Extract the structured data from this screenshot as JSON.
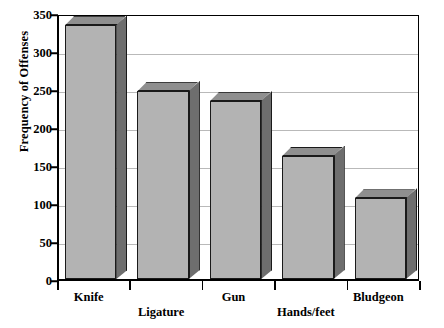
{
  "chart_data": {
    "type": "bar",
    "title": "",
    "subtitle": "",
    "xlabel": "",
    "ylabel": "Frequency of Offenses",
    "categories": [
      "Knife",
      "Ligature",
      "Gun",
      "Hands/feet",
      "Bludgeon"
    ],
    "values": [
      334,
      247,
      234,
      162,
      106
    ],
    "ylim": [
      0,
      350
    ],
    "yticks": [
      0,
      50,
      100,
      150,
      200,
      250,
      300,
      350
    ],
    "ytick_labels": [
      "0",
      "50",
      "100",
      "150",
      "200",
      "250",
      "300",
      "350"
    ],
    "grid": true,
    "grid_axis": "y",
    "legend": false,
    "legend_position": "none",
    "bar_style": "3d-shaded",
    "colors": {
      "bar_face": "#b3b3b3",
      "bar_side": "#6e6e6e",
      "bar_top": "#8f8f8f",
      "bar_outline": "#1a1a1a",
      "gridline": "#b9b9b9",
      "axis": "#000000",
      "background": "#ffffff",
      "text": "#000000"
    }
  }
}
